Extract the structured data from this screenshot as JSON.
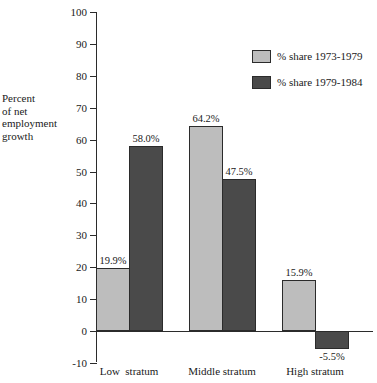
{
  "chart_data": {
    "type": "bar",
    "title": "",
    "subtitle": "",
    "xlabel": "",
    "ylabel": "Percent\nof net\nemployment\ngrowth",
    "categories": [
      "Low  stratum",
      "Middle stratum",
      "High stratum"
    ],
    "series": [
      {
        "name": "% share 1973-1979",
        "color": "#bdbdbd",
        "values": [
          19.9,
          64.2,
          15.9
        ],
        "labels": [
          "19.9%",
          "64.2%",
          "15.9%"
        ]
      },
      {
        "name": "% share 1979-1984",
        "color": "#4a4a4a",
        "values": [
          58.0,
          47.5,
          -5.5
        ],
        "labels": [
          "58.0%",
          "47.5%",
          "-5.5%"
        ]
      }
    ],
    "ylim": [
      -10,
      100
    ],
    "ytick_step": 10,
    "ytick_labels": [
      "100",
      "90",
      "80",
      "70",
      "60",
      "50",
      "40",
      "30",
      "20",
      "10",
      "0",
      "-10"
    ],
    "ytick_values": [
      100,
      90,
      80,
      70,
      60,
      50,
      40,
      30,
      20,
      10,
      0,
      -10
    ],
    "grid": false,
    "legend_position": "top-right",
    "zero_line": 0
  },
  "axis": {
    "y_title": "Percent\nof net\nemployment\ngrowth"
  },
  "legend": {
    "items": [
      {
        "label": "% share 1973-1979",
        "color": "#bdbdbd"
      },
      {
        "label": "% share 1979-1984",
        "color": "#4a4a4a"
      }
    ]
  },
  "colors": {
    "series_light": "#bdbdbd",
    "series_dark": "#4a4a4a",
    "axis": "#2b2b2b",
    "text": "#1a1a1a",
    "background": "#ffffff"
  }
}
